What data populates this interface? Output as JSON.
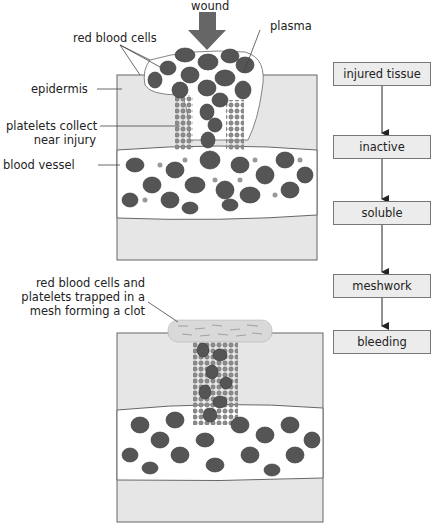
{
  "diagram": {
    "top_panel": {
      "labels": {
        "wound": "wound",
        "plasma": "plasma",
        "red_blood_cells": "red blood cells",
        "epidermis": "epidermis",
        "platelets_line1": "platelets collect",
        "platelets_line2": "near injury",
        "blood_vessel": "blood vessel"
      }
    },
    "bottom_panel": {
      "labels": {
        "clot_line1": "red blood cells and",
        "clot_line2": "platelets trapped in a",
        "clot_line3": "mesh forming a clot"
      }
    },
    "flowchart": {
      "steps": [
        {
          "label": "injured tissue"
        },
        {
          "label": "inactive"
        },
        {
          "label": "soluble"
        },
        {
          "label": "meshwork"
        },
        {
          "label": "bleeding"
        }
      ]
    },
    "colors": {
      "tissue": "#e6e6e6",
      "vessel": "#ffffff",
      "cell": "#555555",
      "platelet": "#999999",
      "arrow": "#666666",
      "box_fill": "#ececec",
      "box_border": "#777777"
    }
  }
}
